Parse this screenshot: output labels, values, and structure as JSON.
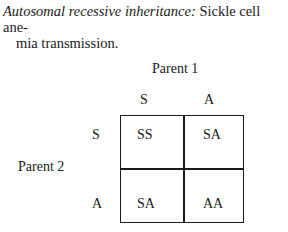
{
  "caption": {
    "lead": "Autosomal recessive inheritance:",
    "line1_rest": " Sickle cell ane-",
    "line2": "mia transmission."
  },
  "punnett": {
    "parent1_label": "Parent 1",
    "parent2_label": "Parent 2",
    "columns": [
      "S",
      "A"
    ],
    "rows": [
      "S",
      "A"
    ],
    "cells": [
      [
        "SS",
        "SA"
      ],
      [
        "SA",
        "AA"
      ]
    ]
  }
}
